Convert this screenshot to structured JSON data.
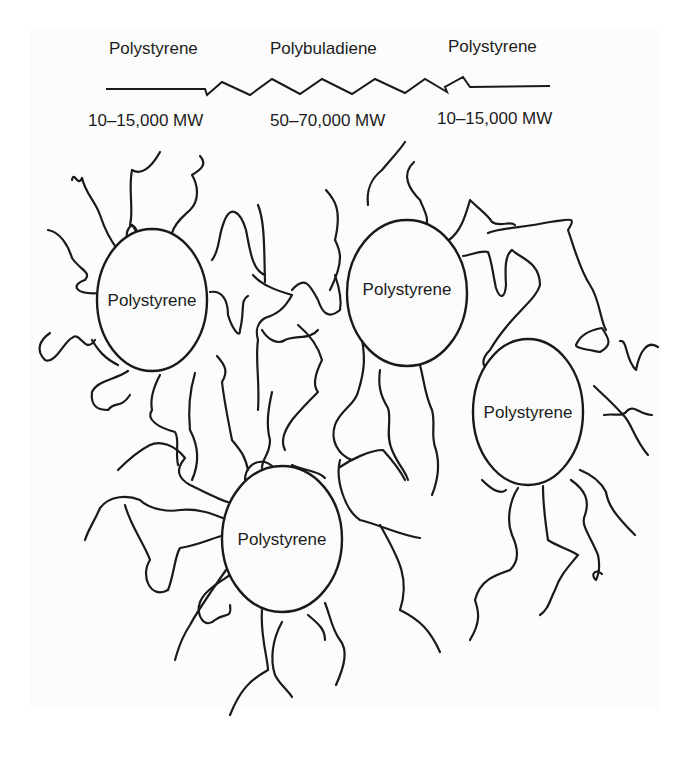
{
  "diagram": {
    "title_row": {
      "left_block": "Polystyrene",
      "middle_block": "Polybuladiene",
      "right_block": "Polystyrene"
    },
    "mw_row": {
      "left_mw": "10–15,000 MW",
      "middle_mw": "50–70,000 MW",
      "right_mw": "10–15,000 MW"
    },
    "domains": [
      {
        "id": "domain-top-left",
        "label": "Polystyrene"
      },
      {
        "id": "domain-top-center",
        "label": "Polystyrene"
      },
      {
        "id": "domain-right",
        "label": "Polystyrene"
      },
      {
        "id": "domain-bottom",
        "label": "Polystyrene"
      }
    ],
    "colors": {
      "line": "#1a1a1a",
      "background": "#ffffff"
    }
  }
}
